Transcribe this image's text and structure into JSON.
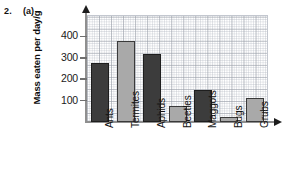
{
  "question": {
    "number": "2.",
    "part": "(a)"
  },
  "chart_data": {
    "type": "bar",
    "title": "",
    "xlabel": "",
    "ylabel": "Mass eaten per day/g",
    "categories": [
      "Ants",
      "Termites",
      "Aphids",
      "Beetles",
      "Maggots",
      "Bugs",
      "Grubs"
    ],
    "values": [
      275,
      380,
      320,
      75,
      150,
      22,
      112
    ],
    "series": [
      {
        "name": "Mass eaten per day",
        "values": [
          275,
          380,
          320,
          75,
          150,
          22,
          112
        ]
      }
    ],
    "bar_colors": [
      "#3c3c3c",
      "#a9a9a9",
      "#3c3c3c",
      "#a9a9a9",
      "#3c3c3c",
      "#a9a9a9",
      "#a9a9a9"
    ],
    "ylim": [
      0,
      500
    ],
    "yticks": [
      100,
      200,
      300,
      400
    ],
    "ytick_labels": [
      "100",
      "200",
      "300",
      "400"
    ],
    "grid": true,
    "grid_style": "graph-paper",
    "legend": "none",
    "axis_arrows": true
  },
  "colors": {
    "bar_dark": "#3c3c3c",
    "bar_light": "#a9a9a9",
    "grid_minor": "#b2b7c0",
    "grid_major": "#969ba5",
    "axis": "#8f8f8f",
    "text": "#111111",
    "background": "#ffffff"
  },
  "icons": {
    "y_axis_arrow": "arrow-up-icon",
    "x_axis_arrow": "arrow-right-icon"
  }
}
